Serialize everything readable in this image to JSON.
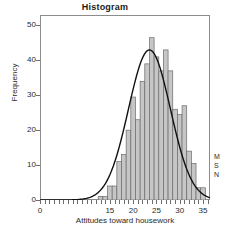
{
  "chart_data": {
    "type": "bar",
    "title": "Histogram",
    "xlabel": "Attitudes toward housework",
    "ylabel": "Frequency",
    "xlim": [
      0,
      36.5
    ],
    "ylim": [
      0,
      53
    ],
    "grid": false,
    "legend": null,
    "x_ticks": [
      0,
      15,
      20,
      25,
      30,
      35
    ],
    "y_ticks": [
      0,
      10,
      20,
      30,
      40,
      50
    ],
    "bin_width": 1,
    "bar_fill": "#c6c6c6",
    "bar_edge": "#6b6b6b",
    "curve_color": "#111111",
    "curve_label": "normal-distribution-overlay",
    "categories": [
      13,
      14,
      15,
      16,
      17,
      18,
      19,
      20,
      21,
      22,
      23,
      24,
      25,
      26,
      27,
      28,
      29,
      30,
      31,
      32,
      33,
      34,
      35
    ],
    "values": [
      1,
      1,
      4,
      4,
      11,
      13,
      20,
      29.5,
      23,
      34,
      39,
      46.5,
      41,
      37,
      43,
      37,
      26,
      24.5,
      27,
      14,
      10.5,
      3.5,
      3.5
    ],
    "curve": {
      "type": "normal",
      "mean": 23.5,
      "sd": 4.5,
      "peak": 43
    },
    "annotations": [
      "M",
      "S",
      "N"
    ]
  },
  "side_notes": [
    "M",
    "S",
    "N"
  ]
}
